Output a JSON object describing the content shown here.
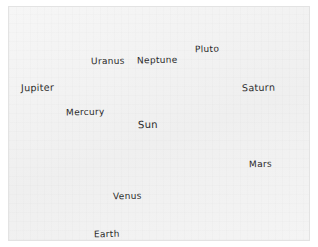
{
  "diagram": {
    "style": "pencil-sketch",
    "background_color": "#f2f2f2",
    "ink_color": "#2b2b2b",
    "border_color": "#e3e3e3"
  },
  "chart_data": {
    "type": "diagram",
    "bodies": [
      {
        "name": "Jupiter",
        "label": "Jupiter",
        "kind": "planet",
        "cx": 42,
        "cy": 48,
        "r": 29,
        "has_rings": false,
        "texture": "bands-swirl",
        "fill": "#d2d2d2",
        "label_x": 12,
        "label_y": 75,
        "font_size": 9.5
      },
      {
        "name": "Uranus",
        "label": "Uranus",
        "kind": "planet",
        "cx": 103,
        "cy": 30,
        "r": 12,
        "has_rings": true,
        "ring_tilt": -62,
        "ring_rx": 22,
        "ring_ry": 7,
        "texture": "bands",
        "fill": "#b9b9b9",
        "label_x": 82,
        "label_y": 49,
        "font_size": 9
      },
      {
        "name": "Neptune",
        "label": "Neptune",
        "kind": "planet",
        "cx": 153,
        "cy": 30,
        "r": 11,
        "has_rings": false,
        "texture": "bands",
        "fill": "#9f9f9f",
        "label_x": 128,
        "label_y": 48,
        "font_size": 9
      },
      {
        "name": "Pluto",
        "label": "Pluto",
        "kind": "dwarf-planet",
        "cx": 199,
        "cy": 23,
        "r": 6,
        "has_rings": false,
        "texture": "solid",
        "fill": "#7d7d7d",
        "label_x": 186,
        "label_y": 37,
        "font_size": 9
      },
      {
        "name": "Saturn",
        "label": "Saturn",
        "kind": "planet",
        "cx": 253,
        "cy": 40,
        "r": 19,
        "has_rings": true,
        "ring_tilt": -20,
        "ring_rx": 40,
        "ring_ry": 13,
        "texture": "bands",
        "fill": "#c6c6c6",
        "label_x": 233,
        "label_y": 75,
        "font_size": 9.5
      },
      {
        "name": "Sun",
        "label": "Sun",
        "kind": "star",
        "cx": 148,
        "cy": 129,
        "r": 40,
        "has_rings": false,
        "texture": "radial-glow",
        "fill": "#cfcfcf",
        "label_x": 129,
        "label_y": 112,
        "font_size": 10,
        "rays": 28
      },
      {
        "name": "Mercury",
        "label": "Mercury",
        "kind": "planet",
        "cx": 109,
        "cy": 104,
        "r": 5,
        "has_rings": false,
        "texture": "solid",
        "fill": "#c0c0c0",
        "label_x": 57,
        "label_y": 100,
        "font_size": 9
      },
      {
        "name": "Mars",
        "label": "Mars",
        "kind": "planet",
        "cx": 254,
        "cy": 134,
        "r": 10,
        "has_rings": false,
        "texture": "bands",
        "fill": "#a8a8a8",
        "label_x": 240,
        "label_y": 152,
        "font_size": 9
      },
      {
        "name": "Venus",
        "label": "Venus",
        "kind": "planet",
        "cx": 96,
        "cy": 179,
        "r": 8,
        "has_rings": false,
        "texture": "solid",
        "fill": "#9d9d9d",
        "label_x": 104,
        "label_y": 184,
        "font_size": 9
      },
      {
        "name": "Earth",
        "label": "Earth",
        "kind": "planet",
        "cx": 73,
        "cy": 217,
        "r": 9,
        "has_rings": false,
        "texture": "continents",
        "fill": "#4a4a4a",
        "label_x": 85,
        "label_y": 222,
        "font_size": 9
      }
    ]
  }
}
